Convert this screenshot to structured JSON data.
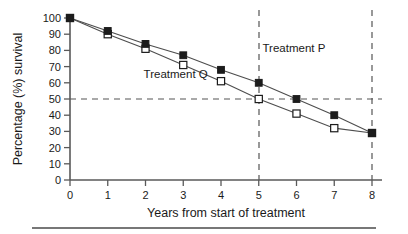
{
  "chart_data": {
    "type": "line",
    "title": "",
    "subtitle": "",
    "xlabel": "Years from start of treatment",
    "ylabel": "Percentage (%) survival",
    "x": [
      0,
      1,
      2,
      3,
      4,
      5,
      6,
      7,
      8
    ],
    "xlim": [
      0,
      8
    ],
    "ylim": [
      0,
      100
    ],
    "xticks": [
      "0",
      "1",
      "2",
      "3",
      "4",
      "5",
      "6",
      "7",
      "8"
    ],
    "yticks": [
      "0",
      "10",
      "20",
      "30",
      "40",
      "50",
      "60",
      "70",
      "80",
      "90",
      "100"
    ],
    "grid": false,
    "legend_position": "inline-annotation",
    "series": [
      {
        "name": "Treatment P",
        "marker": "filled-square",
        "values": [
          100,
          92,
          84,
          77,
          68,
          60,
          50,
          40,
          29
        ],
        "label_x": 5.1,
        "label_y": 79
      },
      {
        "name": "Treatment Q",
        "marker": "open-square",
        "values": [
          100,
          90,
          81,
          71,
          61,
          50,
          41,
          32,
          29
        ],
        "label_x": 1.95,
        "label_y": 63
      }
    ],
    "annotations": [
      {
        "name": "median-survival-line",
        "type": "hline",
        "value": 50,
        "style": "dashed"
      },
      {
        "name": "year-5-line",
        "type": "vline",
        "value": 5,
        "style": "dashed"
      },
      {
        "name": "year-8-line",
        "type": "vline",
        "value": 8,
        "style": "dashed"
      }
    ]
  },
  "labels": {
    "ylabel": "Percentage (%) survival",
    "xlabel": "Years from start of treatment",
    "treatment_p": "Treatment P",
    "treatment_q": "Treatment Q",
    "y_100": "100",
    "y_90": "90",
    "y_80": "80",
    "y_70": "70",
    "y_60": "60",
    "y_50": "50",
    "y_40": "40",
    "y_30": "30",
    "y_20": "20",
    "y_10": "10",
    "y_0": "0",
    "x_0": "0",
    "x_1": "1",
    "x_2": "2",
    "x_3": "3",
    "x_4": "4",
    "x_5": "5",
    "x_6": "6",
    "x_7": "7",
    "x_8": "8"
  },
  "colors": {
    "axis": "#595959",
    "line": "#4d4d4d",
    "marker_fill": "#1c1c1c",
    "marker_open": "#ffffff",
    "reference": "#555555",
    "text": "#1a1a1a",
    "background": "#ffffff"
  }
}
